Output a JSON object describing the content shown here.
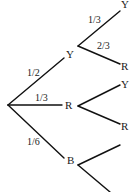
{
  "diagram": {
    "type": "probability-tree",
    "root": {
      "branches": [
        {
          "probability": "1/2",
          "outcome": "Y",
          "branches": [
            {
              "probability": "1/3",
              "outcome": "Y"
            },
            {
              "probability": "2/3",
              "outcome": "R"
            }
          ]
        },
        {
          "probability": "1/3",
          "outcome": "R",
          "branches": [
            {
              "probability": "",
              "outcome": "Y"
            },
            {
              "probability": "",
              "outcome": "R"
            }
          ]
        },
        {
          "probability": "1/6",
          "outcome": "B",
          "branches": [
            {
              "probability": "",
              "outcome": ""
            },
            {
              "probability": "",
              "outcome": ""
            }
          ]
        }
      ]
    }
  }
}
